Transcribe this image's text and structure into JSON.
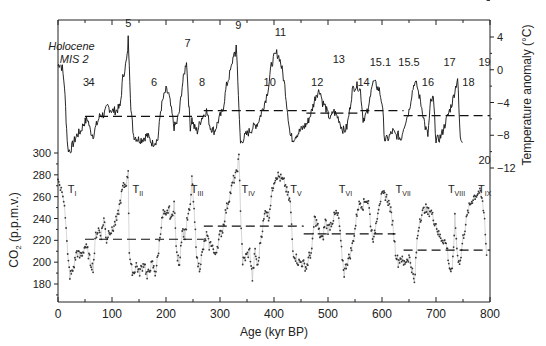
{
  "chart_data": [
    {
      "type": "line",
      "title": "",
      "panel": "top",
      "xlabel": "Age (kyr BP)",
      "ylabel": "Temperature anomaly (°C)",
      "ylabel_side": "right",
      "xlim": [
        0,
        800
      ],
      "ylim": [
        -12,
        6
      ],
      "yticks": [
        4,
        0,
        -4,
        -8,
        -12
      ],
      "ytick_labels": [
        "4",
        "0",
        "−4",
        "−8",
        "−12"
      ],
      "grid": false,
      "series": [
        {
          "name": "Antarctic temperature anomaly",
          "x": [
            0,
            3,
            8,
            12,
            15,
            18,
            22,
            28,
            35,
            42,
            48,
            55,
            60,
            65,
            70,
            78,
            85,
            92,
            100,
            108,
            115,
            120,
            125,
            128,
            130,
            132,
            135,
            140,
            148,
            155,
            165,
            175,
            185,
            190,
            195,
            200,
            205,
            210,
            215,
            220,
            225,
            230,
            238,
            242,
            245,
            248,
            252,
            258,
            265,
            270,
            275,
            282,
            290,
            298,
            305,
            312,
            318,
            322,
            325,
            328,
            330,
            333,
            335,
            338,
            342,
            348,
            355,
            362,
            370,
            378,
            385,
            390,
            395,
            400,
            405,
            410,
            415,
            420,
            425,
            430,
            435,
            440,
            448,
            455,
            462,
            470,
            478,
            485,
            490,
            495,
            500,
            505,
            510,
            515,
            520,
            525,
            530,
            535,
            540,
            545,
            550,
            555,
            560,
            565,
            570,
            575,
            580,
            585,
            590,
            595,
            600,
            605,
            610,
            615,
            620,
            625,
            630,
            635,
            640,
            645,
            650,
            655,
            660,
            665,
            670,
            675,
            680,
            685,
            690,
            695,
            700,
            705,
            710,
            715,
            720,
            725,
            730,
            735,
            740,
            745,
            750,
            755,
            760,
            765,
            770,
            775,
            780,
            785,
            788,
            790,
            793,
            796,
            800
          ],
          "y": [
            0.5,
            0.8,
            0.2,
            -2,
            -6,
            -9.5,
            -10,
            -9,
            -8,
            -7.5,
            -6.5,
            -6,
            -7.5,
            -8,
            -7,
            -5.5,
            -5.5,
            -4.5,
            -5,
            -5,
            -4.5,
            -1,
            0.5,
            1.5,
            3.8,
            1,
            -5,
            -8,
            -8.5,
            -8.5,
            -8,
            -9,
            -8.5,
            -5,
            -3.5,
            -2.5,
            -3,
            -5,
            -7,
            -6.5,
            -5,
            -2,
            1.2,
            -4,
            -7,
            -6,
            -7,
            -7.5,
            -6,
            -5.5,
            -5,
            -7,
            -7.5,
            -6,
            -5,
            -2,
            -0.5,
            0.5,
            2,
            1.5,
            3.2,
            -1,
            -5,
            -9,
            -8.5,
            -8,
            -7.5,
            -7,
            -6.5,
            -5,
            -3.5,
            -2,
            0.5,
            1.5,
            2,
            1.5,
            0,
            -2,
            -5,
            -8,
            -8.5,
            -8,
            -7.5,
            -7,
            -6.5,
            -5,
            -3,
            -2.5,
            -4,
            -4.5,
            -5.5,
            -6,
            -5,
            -5.5,
            -6,
            -7,
            -7.5,
            -7,
            -5,
            -2.5,
            -2,
            -2,
            -2.5,
            -6,
            -5.5,
            -5,
            -2,
            -1.5,
            -2,
            -2.5,
            -4,
            -8.5,
            -8.5,
            -8,
            -7.5,
            -8,
            -8,
            -8.5,
            -7,
            -6,
            -5,
            -3,
            -1.5,
            -2,
            -3.5,
            -5,
            -7,
            -8,
            -4,
            -3.5,
            -8.5,
            -8.5,
            -8,
            -7,
            -6,
            -5,
            -4,
            -2.5,
            -1,
            -8.5,
            -8.5
          ]
        },
        {
          "name": "Interglacial mean (dashed)",
          "segments": [
            {
              "x": [
                50,
                270
              ],
              "y": [
                -5.7,
                -5.7
              ]
            },
            {
              "x": [
                270,
                460
              ],
              "y": [
                -5.0,
                -5.0
              ]
            },
            {
              "x": [
                460,
                560
              ],
              "y": [
                -5.3,
                -5.3
              ]
            },
            {
              "x": [
                560,
                640
              ],
              "y": [
                -5.0,
                -5.0
              ]
            },
            {
              "x": [
                640,
                800
              ],
              "y": [
                -5.6,
                -5.6
              ]
            }
          ]
        }
      ],
      "annotations": [
        {
          "text": "Holocene",
          "x": 25,
          "y": 2.4,
          "italic": true
        },
        {
          "text": "MIS 2",
          "x": 30,
          "y": 0.8,
          "italic": true
        },
        {
          "text": "3",
          "x": 52,
          "y": -2
        },
        {
          "text": "4",
          "x": 62,
          "y": -2
        },
        {
          "text": "5",
          "x": 130,
          "y": 5.2
        },
        {
          "text": "6",
          "x": 178,
          "y": -2
        },
        {
          "text": "7",
          "x": 240,
          "y": 2.8
        },
        {
          "text": "8",
          "x": 267,
          "y": -2
        },
        {
          "text": "9",
          "x": 334,
          "y": 5.0
        },
        {
          "text": "10",
          "x": 392,
          "y": -2
        },
        {
          "text": "11",
          "x": 412,
          "y": 4.1
        },
        {
          "text": "12",
          "x": 480,
          "y": -2
        },
        {
          "text": "13",
          "x": 520,
          "y": 0.8
        },
        {
          "text": "14",
          "x": 566,
          "y": -2
        },
        {
          "text": "15.1",
          "x": 597,
          "y": 0.4
        },
        {
          "text": "15.5",
          "x": 650,
          "y": 0.4
        },
        {
          "text": "16",
          "x": 685,
          "y": -2
        },
        {
          "text": "17",
          "x": 725,
          "y": 0.4
        },
        {
          "text": "18",
          "x": 760,
          "y": -2
        },
        {
          "text": "19",
          "x": 790,
          "y": 0.4
        },
        {
          "text": "20",
          "x": 790,
          "y": -11.5
        }
      ]
    },
    {
      "type": "scatter",
      "title": "",
      "panel": "bottom",
      "xlabel": "Age (kyr BP)",
      "ylabel": "CO₂ (p.p.m.v.)",
      "ylabel_side": "left",
      "xlim": [
        0,
        800
      ],
      "xticks": [
        0,
        100,
        200,
        300,
        400,
        500,
        600,
        700,
        800
      ],
      "xtick_labels": [
        "0",
        "100",
        "200",
        "300",
        "400",
        "500",
        "600",
        "700",
        "800"
      ],
      "ylim": [
        165,
        300
      ],
      "yticks": [
        300,
        280,
        260,
        240,
        220,
        200,
        180
      ],
      "ytick_labels": [
        "300",
        "280",
        "260",
        "240",
        "220",
        "200",
        "180"
      ],
      "grid": false,
      "series": [
        {
          "name": "CO2 concentration",
          "x": [
            0,
            3,
            6,
            9,
            12,
            15,
            18,
            22,
            26,
            30,
            35,
            40,
            45,
            50,
            55,
            60,
            65,
            70,
            75,
            80,
            85,
            90,
            95,
            100,
            105,
            110,
            115,
            120,
            125,
            128,
            130,
            132,
            135,
            140,
            145,
            150,
            155,
            160,
            165,
            170,
            175,
            180,
            185,
            190,
            195,
            200,
            205,
            210,
            215,
            220,
            225,
            230,
            235,
            240,
            245,
            248,
            252,
            258,
            262,
            268,
            275,
            280,
            285,
            290,
            295,
            300,
            305,
            310,
            315,
            320,
            325,
            330,
            335,
            338,
            342,
            348,
            355,
            360,
            365,
            370,
            375,
            380,
            385,
            390,
            395,
            400,
            405,
            410,
            415,
            420,
            425,
            430,
            435,
            440,
            445,
            450,
            455,
            460,
            465,
            470,
            475,
            480,
            485,
            490,
            495,
            500,
            505,
            510,
            515,
            520,
            525,
            530,
            535,
            540,
            545,
            550,
            555,
            560,
            565,
            570,
            575,
            580,
            585,
            590,
            595,
            600,
            605,
            610,
            615,
            620,
            625,
            630,
            635,
            640,
            645,
            650,
            655,
            660,
            665,
            670,
            675,
            680,
            685,
            690,
            695,
            700,
            705,
            710,
            715,
            720,
            725,
            730,
            735,
            740,
            745,
            750,
            755,
            760,
            765,
            770,
            775,
            780,
            785,
            790,
            795,
            800
          ],
          "y": [
            280,
            270,
            265,
            262,
            255,
            230,
            205,
            188,
            190,
            198,
            210,
            205,
            208,
            215,
            210,
            200,
            195,
            225,
            230,
            225,
            240,
            220,
            230,
            228,
            235,
            240,
            255,
            268,
            272,
            275,
            285,
            210,
            195,
            190,
            198,
            190,
            195,
            200,
            185,
            195,
            198,
            190,
            205,
            230,
            245,
            240,
            250,
            238,
            255,
            205,
            200,
            230,
            225,
            240,
            250,
            278,
            245,
            200,
            195,
            210,
            225,
            215,
            218,
            205,
            215,
            225,
            230,
            245,
            255,
            265,
            275,
            280,
            295,
            250,
            200,
            205,
            210,
            185,
            210,
            195,
            220,
            235,
            250,
            240,
            260,
            275,
            280,
            278,
            275,
            272,
            262,
            255,
            210,
            205,
            200,
            200,
            198,
            195,
            205,
            210,
            240,
            235,
            225,
            220,
            238,
            230,
            235,
            240,
            245,
            240,
            210,
            190,
            200,
            205,
            215,
            230,
            250,
            255,
            252,
            258,
            255,
            230,
            220,
            240,
            255,
            260,
            262,
            258,
            250,
            235,
            210,
            200,
            205,
            198,
            202,
            205,
            195,
            180,
            220,
            240,
            245,
            250,
            245,
            248,
            240,
            235,
            225,
            222,
            220,
            215,
            195,
            190,
            240,
            205,
            200,
            222,
            235,
            248,
            255,
            260,
            262,
            265,
            258,
            240,
            195
          ]
        },
        {
          "name": "Interglacial mean (dashed)",
          "segments": [
            {
              "x": [
                50,
                270
              ],
              "y": [
                221,
                221
              ]
            },
            {
              "x": [
                270,
                455
              ],
              "y": [
                233,
                233
              ]
            },
            {
              "x": [
                455,
                625
              ],
              "y": [
                226,
                226
              ]
            },
            {
              "x": [
                640,
                800
              ],
              "y": [
                211,
                211
              ]
            }
          ]
        }
      ],
      "annotations": [
        {
          "text": "T",
          "sub": "I",
          "x": 18,
          "y": 263
        },
        {
          "text": "T",
          "sub": "II",
          "x": 138,
          "y": 263
        },
        {
          "text": "T",
          "sub": "III",
          "x": 246,
          "y": 263
        },
        {
          "text": "T",
          "sub": "IV",
          "x": 340,
          "y": 263
        },
        {
          "text": "T",
          "sub": "V",
          "x": 430,
          "y": 263
        },
        {
          "text": "T",
          "sub": "VI",
          "x": 520,
          "y": 263
        },
        {
          "text": "T",
          "sub": "VII",
          "x": 625,
          "y": 263
        },
        {
          "text": "T",
          "sub": "VIII",
          "x": 722,
          "y": 263
        },
        {
          "text": "T",
          "sub": "IX",
          "x": 778,
          "y": 263
        }
      ]
    }
  ],
  "labels": {
    "xlabel": "Age (kyr BP)",
    "ylabel_left_main": "CO",
    "ylabel_left_sub": "2",
    "ylabel_left_rest": " (p.p.m.v.)",
    "ylabel_right": "Temperature anomaly (°C)"
  }
}
